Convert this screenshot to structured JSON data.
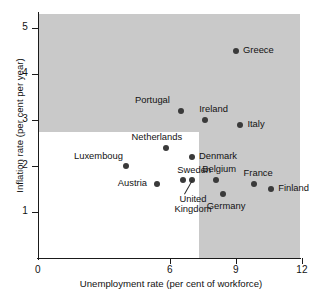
{
  "chart_data": {
    "type": "scatter",
    "title": "",
    "xlabel": "Unemployment rate (per cent of workforce)",
    "ylabel": "Inflation rate (per cent per year)",
    "xlim": [
      0,
      15.6
    ],
    "ylim": [
      0,
      5.3
    ],
    "xticks": [
      0,
      6,
      9,
      12,
      15
    ],
    "xticklabels": [
      "0",
      "6",
      "9",
      "12",
      "15"
    ],
    "yticks": [
      1,
      2,
      3,
      4,
      5
    ],
    "yticklabels": [
      "1",
      "2",
      "3",
      "4",
      "5"
    ],
    "grid": false,
    "legend": false,
    "shaded_region": {
      "description": "grey plot background with white rectangle covering low-unemployment / low-inflation corner",
      "background_color": "#c9c9c9",
      "white_rect_x_max": 7.3,
      "white_rect_y_max": 2.75,
      "white_rect_color": "#ffffff"
    },
    "points": [
      {
        "label": "Greece",
        "x": 9.0,
        "y": 4.5,
        "label_pos": "right"
      },
      {
        "label": "Spain",
        "x": 13.0,
        "y": 3.1,
        "label_pos": "right"
      },
      {
        "label": "Portugal",
        "x": 6.5,
        "y": 3.2,
        "label_pos": "above-left"
      },
      {
        "label": "Ireland",
        "x": 7.6,
        "y": 3.0,
        "label_pos": "above-right"
      },
      {
        "label": "Italy",
        "x": 9.2,
        "y": 2.9,
        "label_pos": "right"
      },
      {
        "label": "Netherlands",
        "x": 5.8,
        "y": 2.4,
        "label_pos": "above-left"
      },
      {
        "label": "Denmark",
        "x": 7.0,
        "y": 2.2,
        "label_pos": "right"
      },
      {
        "label": "Luxemboug",
        "x": 4.0,
        "y": 2.0,
        "label_pos": "above-left"
      },
      {
        "label": "Sweden",
        "x": 6.6,
        "y": 1.7,
        "label_pos": "above-right"
      },
      {
        "label": "United Kingdom",
        "x": 7.0,
        "y": 1.7,
        "label_pos": "below-leader"
      },
      {
        "label": "Austria",
        "x": 5.4,
        "y": 1.6,
        "label_pos": "left"
      },
      {
        "label": "Belgium",
        "x": 8.1,
        "y": 1.7,
        "label_pos": "above"
      },
      {
        "label": "France",
        "x": 9.8,
        "y": 1.6,
        "label_pos": "above"
      },
      {
        "label": "Finland",
        "x": 10.6,
        "y": 1.5,
        "label_pos": "right"
      },
      {
        "label": "Germany",
        "x": 8.4,
        "y": 1.4,
        "label_pos": "below"
      }
    ]
  },
  "axes": {
    "x_title": "Unemployment rate (per cent of workforce)",
    "y_title": "Inflation rate (per cent per year)",
    "x_tick_labels": [
      "0",
      "6",
      "9",
      "12",
      "15"
    ],
    "y_tick_labels": [
      "1",
      "2",
      "3",
      "4",
      "5"
    ]
  },
  "labels": {
    "greece": "Greece",
    "spain": "Spain",
    "portugal": "Portugal",
    "ireland": "Ireland",
    "italy": "Italy",
    "netherlands": "Netherlands",
    "denmark": "Denmark",
    "luxemboug": "Luxemboug",
    "sweden": "Sweden",
    "united_kingdom": "United Kingdom",
    "austria": "Austria",
    "belgium": "Belgium",
    "france": "France",
    "finland": "Finland",
    "germany": "Germany"
  },
  "colors": {
    "plot_background": "#c9c9c9",
    "white_region": "#ffffff",
    "marker": "#3a3a3a",
    "axis": "#1a1a1a",
    "text": "#121212"
  }
}
